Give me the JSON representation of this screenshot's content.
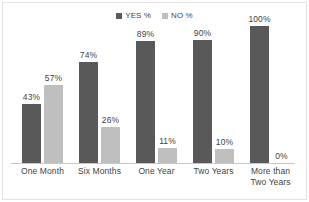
{
  "chart_data": {
    "type": "bar",
    "title": "",
    "subtitle": "",
    "xlabel": "",
    "ylabel": "",
    "ylim": [
      0,
      100
    ],
    "grid": false,
    "legend_position": "top-center",
    "categories": [
      "One Month",
      "Six Months",
      "One Year",
      "Two Years",
      "More than Two Years"
    ],
    "category_lines": [
      [
        "One Month"
      ],
      [
        "Six Months"
      ],
      [
        "One Year"
      ],
      [
        "Two Years"
      ],
      [
        "More than",
        "Two Years"
      ]
    ],
    "series": [
      {
        "name": "YES %",
        "color": "#595959",
        "values": [
          43,
          74,
          89,
          90,
          100
        ],
        "labels": [
          "43%",
          "74%",
          "89%",
          "90%",
          "100%"
        ]
      },
      {
        "name": "NO %",
        "color": "#bfbfbf",
        "values": [
          57,
          26,
          11,
          10,
          0
        ],
        "labels": [
          "57%",
          "26%",
          "11%",
          "10%",
          "0%"
        ]
      }
    ]
  },
  "legend": {
    "items": [
      {
        "label": "YES %",
        "color": "#595959",
        "swatch": "square-marker-icon"
      },
      {
        "label": "NO %",
        "color": "#bfbfbf",
        "swatch": "square-marker-icon"
      }
    ]
  },
  "colors": {
    "yes": "#595959",
    "no": "#bfbfbf",
    "axis": "#c8c8c8",
    "text": "#3f3f3f",
    "background": "#ffffff",
    "frame": "#e3e3e3"
  }
}
